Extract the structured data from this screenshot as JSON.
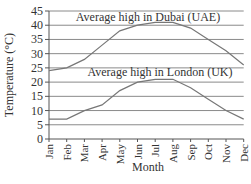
{
  "chart_data": {
    "type": "line",
    "title": "",
    "xlabel": "Month",
    "ylabel": "Temperature (°C)",
    "ylim": [
      0,
      45
    ],
    "yticks": [
      0,
      5,
      10,
      15,
      20,
      25,
      30,
      35,
      40,
      45
    ],
    "grid": true,
    "categories": [
      "Jan",
      "Feb",
      "Mar",
      "Apr",
      "May",
      "Jun",
      "Jul",
      "Aug",
      "Sep",
      "Oct",
      "Nov",
      "Dec"
    ],
    "series": [
      {
        "name": "Average high in Dubai (UAE)",
        "values": [
          24,
          25,
          28,
          33,
          38,
          40,
          41,
          41,
          39,
          35,
          31,
          26
        ],
        "color": "#777777"
      },
      {
        "name": "Average high in London (UK)",
        "values": [
          7,
          7,
          10,
          12,
          17,
          20,
          21,
          21,
          18,
          14,
          10,
          7
        ],
        "color": "#777777"
      }
    ],
    "annotations": [
      {
        "text": "Average high in Dubai (UAE)",
        "near": "Dubai line"
      },
      {
        "text": "Average high in London (UK)",
        "near": "London line"
      }
    ]
  }
}
